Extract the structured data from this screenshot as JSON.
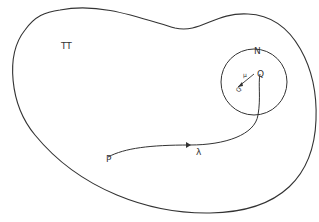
{
  "diagram": {
    "region_label": "TT",
    "neighborhood_label": "N",
    "start_point_label": "P",
    "end_point_label": "Q",
    "nearby_point_label": "Q'",
    "small_segment_label": "μ",
    "path_label": "λ",
    "colors": {
      "stroke": "#333333",
      "background": "#ffffff"
    }
  }
}
